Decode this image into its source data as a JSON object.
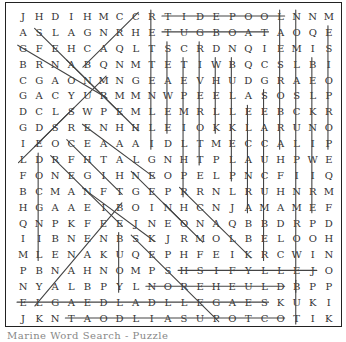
{
  "puzzle": {
    "rows": 20,
    "cols": 20,
    "grid": [
      "JHDIHMCCRTIDEPOOLNNM",
      "ASLAGNRHETUGBOATAOQE",
      "GFEHCAQLTSCRDNQIEMIS",
      "BRNABQNMTETIWBQCSLBI",
      "CGAONMNGEAEVHUDGRAEO",
      "GACYURMMNWPEELASOSLP",
      "DCLSWPEMLEMRLLEEBCKR",
      "GDSRENHHLEIOKKLARUNO",
      "IEOCEAAAIDLTMECCALIP",
      "LDRFHTALGNHTPLAUHPWE",
      "FONEGIHNEOPELPNCFIIQ",
      "BCMANFTGEPRRNLRUHNRM",
      "HGAAEIBOINHCNJAMAMEF",
      "QNPKFEEJNEONAQBBDRPD",
      "IIBNENBSKJRMOLBELOOH",
      "MLENAKUQEPHFEIKRCWIN",
      "PBNAHNOMPSHSIFYLLEJO",
      "NYALBPYLNOREHEULDBPP",
      "ELGAEDLADLLEGAESKUKI",
      "JKNTAODLIASUPOTCOTIK"
    ],
    "strike_lines": [
      {
        "type": "horizontal",
        "row": 1,
        "from_col": 10,
        "to_col": 17
      },
      {
        "type": "horizontal",
        "row": 2,
        "from_col": 10,
        "to_col": 16
      },
      {
        "type": "horizontal",
        "row": 17,
        "from_col": 11,
        "to_col": 19
      },
      {
        "type": "horizontal",
        "row": 18,
        "from_col": 9,
        "to_col": 17
      },
      {
        "type": "horizontal",
        "row": 19,
        "from_col": 1,
        "to_col": 16
      },
      {
        "type": "horizontal",
        "row": 20,
        "from_col": 4,
        "to_col": 17
      },
      {
        "type": "vertical",
        "col": 9,
        "from_row": 1,
        "to_row": 9
      },
      {
        "type": "vertical",
        "col": 10,
        "from_row": 3,
        "to_row": 8
      },
      {
        "type": "vertical",
        "col": 11,
        "from_row": 4,
        "to_row": 12
      },
      {
        "type": "vertical",
        "col": 12,
        "from_row": 3,
        "to_row": 10
      },
      {
        "type": "vertical",
        "col": 13,
        "from_row": 4,
        "to_row": 8
      },
      {
        "type": "vertical",
        "col": 14,
        "from_row": 4,
        "to_row": 11
      },
      {
        "type": "vertical",
        "col": 15,
        "from_row": 7,
        "to_row": 13
      },
      {
        "type": "vertical",
        "col": 16,
        "from_row": 6,
        "to_row": 16
      },
      {
        "type": "vertical",
        "col": 17,
        "from_row": 1,
        "to_row": 9
      },
      {
        "type": "vertical",
        "col": 18,
        "from_row": 1,
        "to_row": 18
      },
      {
        "type": "vertical",
        "col": 19,
        "from_row": 4,
        "to_row": 13
      },
      {
        "type": "vertical",
        "col": 20,
        "from_row": 2,
        "to_row": 9
      },
      {
        "type": "vertical",
        "col": 2,
        "from_row": 10,
        "to_row": 16
      },
      {
        "type": "vertical",
        "col": 7,
        "from_row": 15,
        "to_row": 18
      },
      {
        "type": "vertical",
        "col": 18,
        "from_row": 18,
        "to_row": 20
      },
      {
        "type": "diagonal",
        "from": [
          2,
          2
        ],
        "to": [
          8,
          8
        ]
      },
      {
        "type": "diagonal",
        "from": [
          3,
          1
        ],
        "to": [
          6,
          6
        ]
      },
      {
        "type": "diagonal",
        "from": [
          4,
          4
        ],
        "to": [
          7,
          7
        ]
      },
      {
        "type": "diagonal",
        "from": [
          1,
          8
        ],
        "to": [
          4,
          5
        ]
      },
      {
        "type": "diagonal",
        "from": [
          5,
          6
        ],
        "to": [
          9,
          2
        ]
      },
      {
        "type": "diagonal",
        "from": [
          7,
          4
        ],
        "to": [
          10,
          1
        ]
      },
      {
        "type": "diagonal",
        "from": [
          9,
          4
        ],
        "to": [
          12,
          7
        ]
      },
      {
        "type": "diagonal",
        "from": [
          8,
          5
        ],
        "to": [
          11,
          9
        ]
      },
      {
        "type": "diagonal",
        "from": [
          10,
          3
        ],
        "to": [
          14,
          7
        ]
      },
      {
        "type": "diagonal",
        "from": [
          12,
          5
        ],
        "to": [
          15,
          9
        ]
      },
      {
        "type": "diagonal",
        "from": [
          11,
          8
        ],
        "to": [
          14,
          11
        ]
      },
      {
        "type": "diagonal",
        "from": [
          13,
          10
        ],
        "to": [
          15,
          12
        ]
      },
      {
        "type": "diagonal",
        "from": [
          12,
          11
        ],
        "to": [
          16,
          15
        ]
      },
      {
        "type": "diagonal",
        "from": [
          13,
          7
        ],
        "to": [
          19,
          2
        ]
      },
      {
        "type": "diagonal",
        "from": [
          15,
          8
        ],
        "to": [
          20,
          13
        ]
      }
    ]
  },
  "caption": "Marine Word Search - Puzzle"
}
